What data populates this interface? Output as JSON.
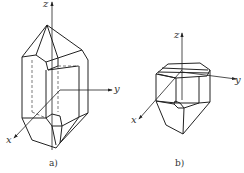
{
  "figure": {
    "panels": [
      {
        "id": "a",
        "caption": "a)",
        "axes": {
          "x": "x",
          "y": "y",
          "z": "z"
        }
      },
      {
        "id": "b",
        "caption": "b)",
        "axes": {
          "x": "x",
          "y": "y",
          "z": "z"
        }
      }
    ]
  }
}
